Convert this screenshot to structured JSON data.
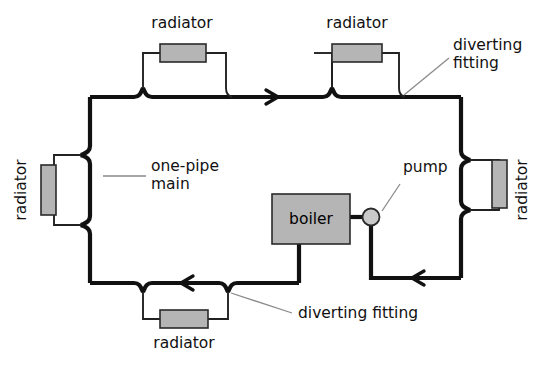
{
  "diagram": {
    "colors": {
      "pipe": "#111111",
      "branch": "#222222",
      "radiator_fill": "#b5b5b5",
      "boiler_fill": "#b5b5b5",
      "pump_fill": "#c9c9c9",
      "leader": "#7a7a7a",
      "background": "#ffffff",
      "text": "#111111"
    },
    "labels": {
      "radiator_top_left": "radiator",
      "radiator_top_right": "radiator",
      "radiator_left": "radiator",
      "radiator_right": "radiator",
      "radiator_bottom": "radiator",
      "one_pipe_main_line1": "one-pipe",
      "one_pipe_main_line2": "main",
      "pump": "pump",
      "boiler": "boiler",
      "diverting_fitting_top_line1": "diverting",
      "diverting_fitting_top_line2": "fitting",
      "diverting_fitting_bottom": "diverting fitting"
    },
    "components": {
      "radiators": [
        {
          "name": "radiator-top-left",
          "orientation": "horizontal"
        },
        {
          "name": "radiator-top-right",
          "orientation": "horizontal"
        },
        {
          "name": "radiator-left",
          "orientation": "vertical"
        },
        {
          "name": "radiator-right",
          "orientation": "vertical"
        },
        {
          "name": "radiator-bottom",
          "orientation": "horizontal"
        }
      ],
      "boiler": {
        "name": "boiler"
      },
      "pump": {
        "name": "pump",
        "shape": "circle"
      },
      "flow_arrows": [
        {
          "name": "flow-arrow-top",
          "direction": "right"
        },
        {
          "name": "flow-arrow-bottom",
          "direction": "left"
        },
        {
          "name": "flow-arrow-return",
          "direction": "left"
        }
      ]
    }
  }
}
